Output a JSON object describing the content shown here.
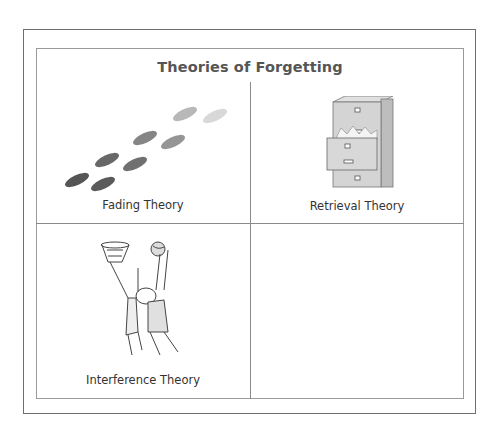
{
  "title": "Theories of Forgetting",
  "quadrants": [
    {
      "label": "Fading Theory",
      "icon": "footprints-icon"
    },
    {
      "label": "Retrieval Theory",
      "icon": "filing-cabinet-icon"
    },
    {
      "label": "Interference Theory",
      "icon": "basketball-players-icon"
    },
    {
      "label": "",
      "icon": ""
    }
  ],
  "colors": {
    "border": "#6e6e6e",
    "text": "#333333",
    "title": "#555555"
  }
}
